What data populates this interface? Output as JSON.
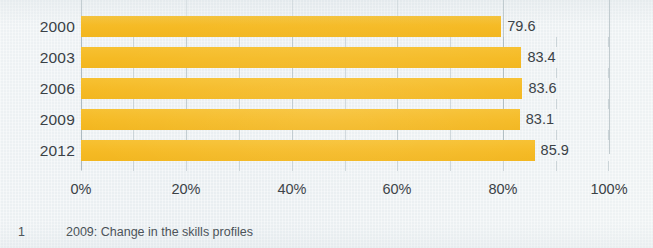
{
  "chart_data": {
    "type": "bar",
    "orientation": "horizontal",
    "title": "",
    "subtitle": "",
    "xlabel": "",
    "ylabel": "",
    "categories": [
      "2000",
      "2003",
      "2006",
      "2009",
      "2012"
    ],
    "values": [
      79.6,
      83.4,
      83.6,
      83.1,
      85.9
    ],
    "value_labels": [
      "79.6",
      "83.4",
      "83.6",
      "83.1",
      "85.9"
    ],
    "xlim": [
      0,
      100
    ],
    "xticks": [
      0,
      20,
      40,
      60,
      80,
      100
    ],
    "xtick_labels": [
      "0%",
      "20%",
      "40%",
      "60%",
      "80%",
      "100%"
    ],
    "grid": true,
    "grid_axis": "x",
    "legend": false,
    "legend_position": "none",
    "bar_color": "#f5ba24",
    "text_color": "#3a4146",
    "background_color": "#edf1f3",
    "gridline_color": "#96a5ac"
  },
  "footnote": {
    "marker": "1",
    "text": "2009: Change in the skills profiles"
  }
}
